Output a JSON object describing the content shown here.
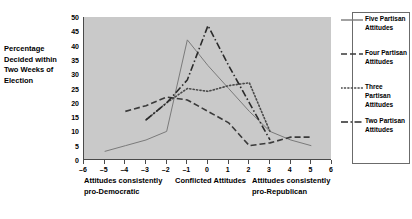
{
  "axis_caption": "Percentage Decided within Two Weeks of Election",
  "annotations": {
    "left": "Attitudes consistently pro-Democratic",
    "middle": "Conflicted Attitudes",
    "right": "Attitudes consistently pro-Republican"
  },
  "chart_data": {
    "type": "line",
    "title": "",
    "xlabel": "",
    "ylabel": "Percentage Decided within Two Weeks of Election",
    "xlim": [
      -6,
      6
    ],
    "ylim": [
      0,
      50
    ],
    "xticks": [
      -6,
      -5,
      -4,
      -3,
      -2,
      -1,
      0,
      1,
      2,
      3,
      4,
      5,
      6
    ],
    "yticks": [
      0,
      5,
      10,
      15,
      20,
      25,
      30,
      35,
      40,
      45,
      50
    ],
    "grid": false,
    "legend_position": "right",
    "x": [
      -6,
      -5,
      -4,
      -3,
      -2,
      -1,
      0,
      1,
      2,
      3,
      4,
      5,
      6
    ],
    "series": [
      {
        "name": "Five Partisan Attitudes",
        "style": "solid",
        "color": "#7a7a7a",
        "x": [
          -5,
          -4,
          -3,
          -2,
          -1,
          0,
          1,
          2,
          3,
          4,
          5
        ],
        "values": [
          3,
          5,
          7,
          10,
          42,
          33,
          25,
          17,
          10,
          7,
          5
        ]
      },
      {
        "name": "Four Partisan Attitudes",
        "style": "dashed",
        "color": "#3a3a3a",
        "x": [
          -4,
          -3,
          -2,
          -1,
          0,
          1,
          2,
          3,
          4,
          5
        ],
        "values": [
          17,
          19,
          22,
          21,
          17,
          13,
          5,
          6,
          8,
          8
        ]
      },
      {
        "name": "Three Partisan Attitudes",
        "style": "dotted",
        "color": "#4a4a4a",
        "x": [
          -3,
          -2,
          -1,
          0,
          1,
          2,
          3
        ],
        "values": [
          14,
          20,
          25,
          24,
          26,
          27,
          10
        ]
      },
      {
        "name": "Two Partisan Attitudes",
        "style": "dashdot",
        "color": "#2b2b2b",
        "x": [
          -3,
          -2,
          -1,
          0,
          1,
          2,
          3
        ],
        "values": [
          14,
          20,
          28,
          47,
          33,
          20,
          7
        ]
      }
    ]
  },
  "legend": {
    "items": [
      {
        "label": "Five Partisan Attitudes",
        "style": "solid"
      },
      {
        "label": "Four Partisan Attitudes",
        "style": "dashed"
      },
      {
        "label": "Three Partisan Attitudes",
        "style": "dotted"
      },
      {
        "label": "Two Partisan Attitudes",
        "style": "dashdot"
      }
    ]
  }
}
